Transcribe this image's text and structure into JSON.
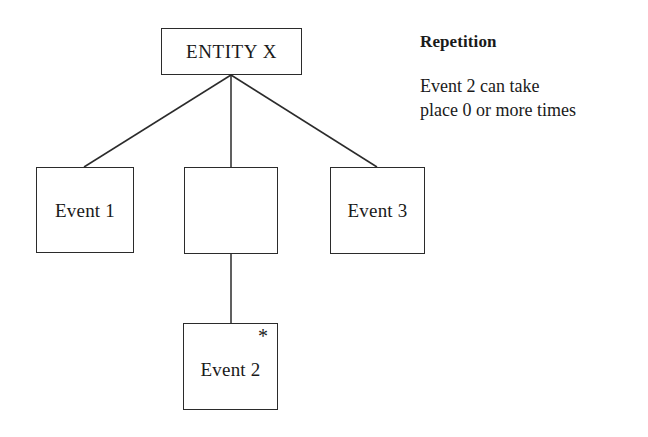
{
  "diagram": {
    "nodes": {
      "entity": {
        "label": "ENTITY X"
      },
      "event1": {
        "label": "Event 1"
      },
      "group": {
        "label": ""
      },
      "event3": {
        "label": "Event 3"
      },
      "event2": {
        "label": "Event 2",
        "marker": "*"
      }
    }
  },
  "annotation": {
    "title": "Repetition",
    "body": "Event 2 can take\nplace 0 or more times"
  },
  "colors": {
    "stroke": "#2b2b2b",
    "background": "#ffffff",
    "text": "#1a1a1a"
  }
}
